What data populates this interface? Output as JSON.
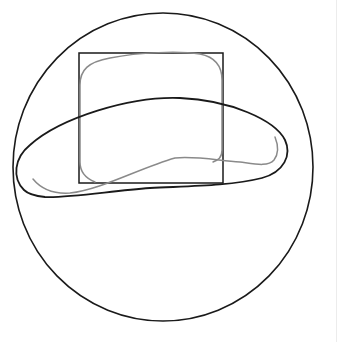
{
  "canvas": {
    "width": 349,
    "height": 342,
    "background": "#ffffff"
  },
  "colors": {
    "stroke_black": "#1a1a1a",
    "stroke_gray": "#8a8a8a",
    "divider": "#ececec"
  },
  "shapes": {
    "circle": {
      "cx": 163,
      "cy": 167,
      "rx": 150,
      "ry": 154,
      "stroke_width": 1.6
    },
    "rectangle": {
      "x": 79,
      "y": 53,
      "width": 144,
      "height": 130,
      "stroke_width": 1.5
    },
    "blob_path": "M 24 190 C 12 178, 14 158, 30 145 C 60 118, 130 96, 180 98 C 230 100, 275 120, 285 140 C 292 155, 284 172, 262 178 C 230 186, 190 186, 150 188 C 110 191, 70 198, 45 197 C 35 196, 28 194, 24 190 Z",
    "gray_rounded_square_path": "M 95 182 C 85 178, 80 172, 80 162 L 80 85 C 80 70, 88 62, 110 58 C 140 52, 180 51, 200 54 C 215 57, 222 66, 222 80 L 222 150 C 222 158, 218 160, 213 162",
    "gray_wave_path": "M 33 179 C 42 190, 55 194, 70 193 C 100 190, 140 168, 175 158 C 195 156, 215 160, 240 162 C 255 164, 268 167, 274 160 C 280 152, 277 142, 275 137",
    "gray_stroke_width": 1.5,
    "blob_stroke_width": 1.8
  },
  "divider": {
    "x": 336
  }
}
